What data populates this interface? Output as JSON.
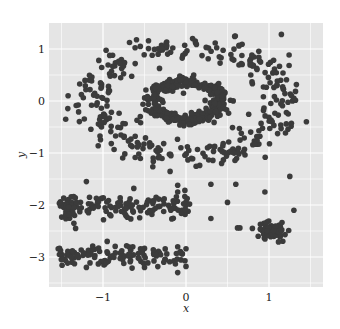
{
  "chart_data": {
    "type": "scatter",
    "title": "",
    "xlabel": "x",
    "ylabel": "y",
    "xlim": [
      -1.65,
      1.65
    ],
    "ylim": [
      -3.55,
      1.5
    ],
    "xticks": [
      -1,
      0,
      1
    ],
    "xtick_labels": [
      "−1",
      "0",
      "1"
    ],
    "yticks": [
      1,
      0,
      -1,
      -2,
      -3
    ],
    "ytick_labels": [
      "1",
      "0",
      "−1",
      "−2",
      "−3"
    ],
    "minor_grid_x": [
      -1.5,
      -0.5,
      0.5,
      1.5
    ],
    "minor_grid_y": [
      0.5,
      -0.5,
      -1.5,
      -2.5,
      -3.5
    ],
    "grid": true,
    "background_color": "#e5e5e5",
    "grid_color": "#ffffff",
    "point_color": "#3b3b3b",
    "legend": "none",
    "series": [
      {
        "name": "inner-ring",
        "shape": {
          "cx": 0.0,
          "cy": 0.0,
          "rx": 0.42,
          "ry": 0.36,
          "thickness": 0.12,
          "n": 320
        },
        "extra_points": [
          [
            -0.03,
            0.15
          ],
          [
            -0.55,
            -0.3
          ]
        ]
      },
      {
        "name": "outer-ring",
        "shape": {
          "cx": 0.03,
          "cy": -0.02,
          "rx": 1.12,
          "ry": 1.05,
          "thickness": 0.3,
          "n": 330
        },
        "extra_points": [
          [
            -1.42,
            0.1
          ],
          [
            -1.45,
            -0.35
          ],
          [
            1.45,
            -0.4
          ],
          [
            1.15,
            1.28
          ],
          [
            -0.9,
            -0.82
          ],
          [
            -0.55,
            1.05
          ],
          [
            -1.05,
            0.78
          ],
          [
            1.3,
            0.05
          ]
        ]
      },
      {
        "name": "band-y-minus-2",
        "shape": {
          "x0": -1.52,
          "x1": 0.05,
          "y": -2.03,
          "spread": 0.13,
          "n": 150,
          "dense_end_x": -1.45
        },
        "extra_points": [
          [
            -1.35,
            -2.35
          ],
          [
            -1.33,
            -2.45
          ],
          [
            -0.1,
            -1.62
          ],
          [
            -1.2,
            -1.55
          ]
        ]
      },
      {
        "name": "band-y-minus-3",
        "shape": {
          "x0": -1.55,
          "x1": 0.0,
          "y": -2.98,
          "spread": 0.11,
          "n": 120
        },
        "extra_points": [
          [
            -0.1,
            -3.3
          ],
          [
            -1.2,
            -3.2
          ],
          [
            -0.95,
            -2.7
          ],
          [
            0.0,
            -3.18
          ],
          [
            -0.5,
            -3.2
          ]
        ]
      },
      {
        "name": "cluster-right",
        "shape": {
          "cx": 1.05,
          "cy": -2.5,
          "sx": 0.08,
          "sy": 0.08,
          "n": 60
        },
        "extra_points": [
          [
            0.62,
            -2.44
          ],
          [
            0.65,
            -2.44
          ],
          [
            0.8,
            -2.45
          ],
          [
            0.87,
            -2.6
          ],
          [
            0.3,
            -2.26
          ],
          [
            0.5,
            -1.95
          ],
          [
            1.3,
            -2.1
          ],
          [
            1.25,
            -1.45
          ],
          [
            0.3,
            -1.6
          ],
          [
            -0.1,
            -1.75
          ],
          [
            0.95,
            -1.75
          ],
          [
            0.6,
            -1.6
          ]
        ]
      }
    ]
  }
}
